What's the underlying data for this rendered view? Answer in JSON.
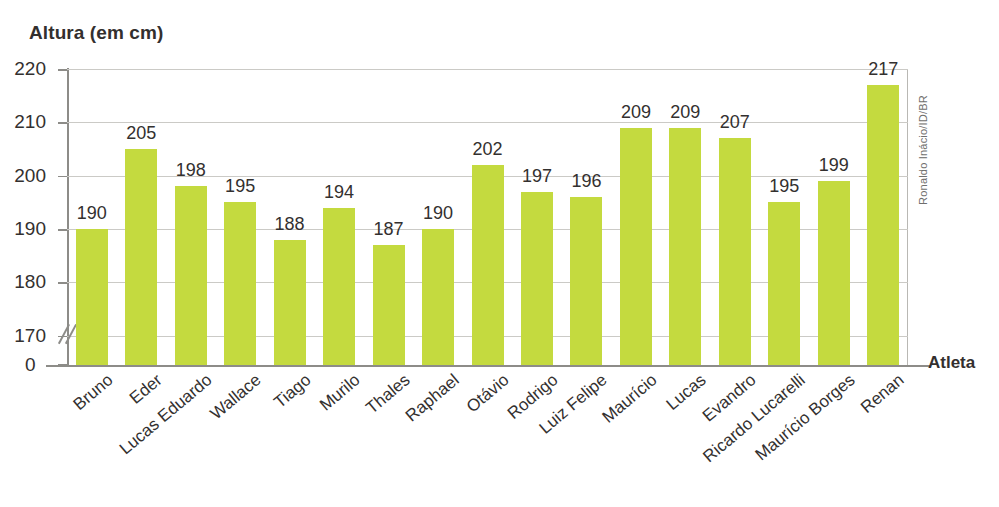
{
  "chart_data": {
    "type": "bar",
    "title": "Altura (em cm)",
    "ylabel": "Altura (em cm)",
    "xlabel": "Atleta",
    "categories": [
      "Bruno",
      "Eder",
      "Lucas Eduardo",
      "Wallace",
      "Tiago",
      "Murilo",
      "Thales",
      "Raphael",
      "Otávio",
      "Rodrigo",
      "Luiz Felipe",
      "Maurício",
      "Lucas",
      "Evandro",
      "Ricardo Lucarelli",
      "Maurício Borges",
      "Renan"
    ],
    "values": [
      190,
      205,
      198,
      195,
      188,
      194,
      187,
      190,
      202,
      197,
      196,
      209,
      209,
      207,
      195,
      199,
      217
    ],
    "ylim": [
      165,
      220
    ],
    "yticks": [
      170,
      180,
      190,
      200,
      210,
      220
    ],
    "ytick_labels": [
      "170",
      "180",
      "190",
      "200",
      "210",
      "220"
    ],
    "zero_tick_label": "0",
    "axis_break": true,
    "grid": true,
    "legend": false,
    "bar_color": "#c4da3f",
    "axis_color": "#8d8c88",
    "grid_color": "#cbcac6",
    "text_color": "#33302f"
  },
  "credit": {
    "text": "Ronaldo Inácio/ID/BR"
  }
}
